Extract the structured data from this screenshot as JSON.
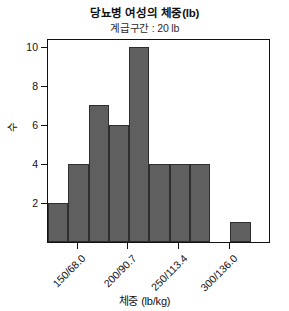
{
  "chart_data": {
    "type": "bar",
    "title": "당뇨병 여성의 체중(lb)",
    "subtitle": "계급구간 : 20 lb",
    "xlabel": "체중 (lb/kg)",
    "ylabel": "수",
    "grid": false,
    "legend": null,
    "bin_width": 20,
    "bin_start": 120,
    "xlim": [
      120,
      340
    ],
    "ylim": [
      0,
      10.45
    ],
    "yticks": [
      2,
      4,
      6,
      8,
      10
    ],
    "xtick_labels": [
      "150/68.0",
      "200/90.7",
      "250/113.4",
      "300/136.0"
    ],
    "xtick_values": [
      150,
      200,
      250,
      300
    ],
    "bins": [
      {
        "range": [
          120,
          140
        ],
        "value": 2
      },
      {
        "range": [
          140,
          160
        ],
        "value": 4
      },
      {
        "range": [
          160,
          180
        ],
        "value": 7
      },
      {
        "range": [
          180,
          200
        ],
        "value": 6
      },
      {
        "range": [
          200,
          220
        ],
        "value": 10
      },
      {
        "range": [
          220,
          240
        ],
        "value": 4
      },
      {
        "range": [
          240,
          260
        ],
        "value": 4
      },
      {
        "range": [
          260,
          280
        ],
        "value": 4
      },
      {
        "range": [
          280,
          300
        ],
        "value": 0
      },
      {
        "range": [
          300,
          320
        ],
        "value": 1
      },
      {
        "range": [
          320,
          340
        ],
        "value": 0
      }
    ],
    "values": [
      2,
      4,
      7,
      6,
      10,
      4,
      4,
      4,
      0,
      1,
      0
    ],
    "categories": [
      "120-140",
      "140-160",
      "160-180",
      "180-200",
      "200-220",
      "220-240",
      "240-260",
      "260-280",
      "280-300",
      "300-320",
      "320-340"
    ],
    "bar_color": "#5f5f5f",
    "bar_edge_color": "#2e2e2e",
    "axis_color": "#111111"
  }
}
